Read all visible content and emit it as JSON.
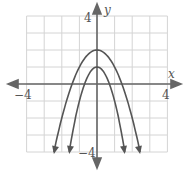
{
  "chart_data": {
    "type": "line",
    "title": "",
    "xlabel": "x",
    "ylabel": "y",
    "xlim": [
      -4,
      4
    ],
    "ylim": [
      -4,
      4
    ],
    "grid": true,
    "tick_labels": {
      "x_min": "−4",
      "x_max": "4",
      "y_min": "−4",
      "y_max": "4"
    },
    "series": [
      {
        "name": "outer parabola",
        "equation": "y = -x^2 + 2",
        "vertex": [
          0,
          2
        ],
        "x_intercepts": [
          -1.41,
          1.41
        ],
        "points": [
          [
            -2.45,
            -4
          ],
          [
            -2,
            -2
          ],
          [
            -1,
            1
          ],
          [
            0,
            2
          ],
          [
            1,
            1
          ],
          [
            2,
            -2
          ],
          [
            2.45,
            -4
          ]
        ]
      },
      {
        "name": "inner parabola",
        "equation": "y = -2x^2 + 1",
        "vertex": [
          0,
          1
        ],
        "x_intercepts": [
          -0.71,
          0.71
        ],
        "points": [
          [
            -1.58,
            -4
          ],
          [
            -1,
            -1
          ],
          [
            0,
            1
          ],
          [
            1,
            -1
          ],
          [
            1.58,
            -4
          ]
        ]
      }
    ]
  },
  "colors": {
    "curve": "#555555",
    "axis": "#666666",
    "grid": "#d0d0d0"
  }
}
